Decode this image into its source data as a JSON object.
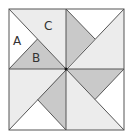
{
  "diagram": {
    "type": "quilt-block-pinwheel",
    "colors": {
      "white": "#ffffff",
      "light": "#ececec",
      "gray": "#c9c9c9",
      "line": "#555555",
      "center_dot": "#111111"
    },
    "labels": {
      "a": "A",
      "b": "B",
      "c": "C"
    }
  }
}
